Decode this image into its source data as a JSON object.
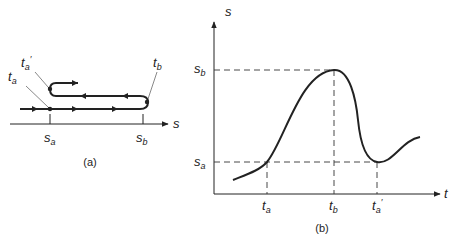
{
  "panel_a": {
    "caption": "(a)",
    "axis_label": "s",
    "tick_labels": [
      {
        "base": "s",
        "sub": "a"
      },
      {
        "base": "s",
        "sub": "b"
      }
    ],
    "point_labels": [
      {
        "base": "t",
        "sub": "a",
        "prime": ""
      },
      {
        "base": "t",
        "sub": "a",
        "prime": "′"
      },
      {
        "base": "t",
        "sub": "b",
        "prime": ""
      }
    ]
  },
  "panel_b": {
    "caption": "(b)",
    "y_axis_label": "s",
    "x_axis_label": "t",
    "y_ticks": [
      {
        "base": "s",
        "sub": "b"
      },
      {
        "base": "s",
        "sub": "a"
      }
    ],
    "x_ticks": [
      {
        "base": "t",
        "sub": "a",
        "prime": ""
      },
      {
        "base": "t",
        "sub": "b",
        "prime": ""
      },
      {
        "base": "t",
        "sub": "a",
        "prime": "′"
      }
    ]
  },
  "colors": {
    "ink": "#222222",
    "background": "#ffffff"
  }
}
